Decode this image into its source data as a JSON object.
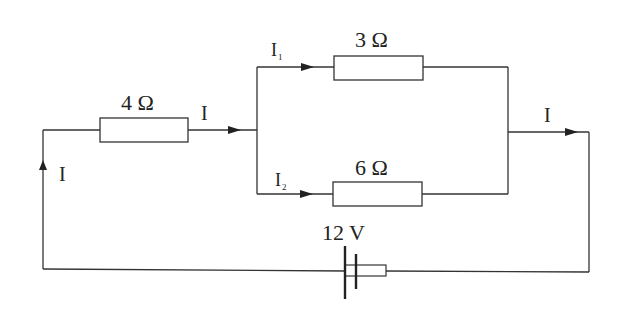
{
  "diagram": {
    "type": "circuit",
    "colors": {
      "line": "#333333",
      "text": "#222222",
      "background": "#ffffff"
    },
    "components": {
      "resistor_series": {
        "label": "4 Ω",
        "value_ohms": 4
      },
      "resistor_top": {
        "label": "3 Ω",
        "value_ohms": 3
      },
      "resistor_bottom": {
        "label": "6 Ω",
        "value_ohms": 6
      },
      "battery": {
        "label": "12 V",
        "value_volts": 12
      }
    },
    "currents": {
      "main_left": {
        "label": "I"
      },
      "main_after_series": {
        "label": "I"
      },
      "branch_top": {
        "label": "I",
        "subscript": "1"
      },
      "branch_bottom": {
        "label": "I",
        "subscript": "2"
      },
      "main_right": {
        "label": "I"
      }
    }
  }
}
